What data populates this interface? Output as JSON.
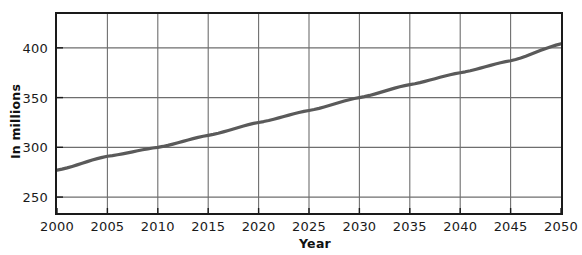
{
  "chart_data": {
    "type": "line",
    "title": "",
    "xlabel": "Year",
    "ylabel": "In millions",
    "x": [
      2000,
      2005,
      2010,
      2015,
      2020,
      2025,
      2030,
      2035,
      2040,
      2045,
      2050
    ],
    "values": [
      277,
      291,
      300,
      312,
      325,
      337,
      350,
      363,
      375,
      387,
      404
    ],
    "series": [
      {
        "name": "Population",
        "values": [
          277,
          291,
          300,
          312,
          325,
          337,
          350,
          363,
          375,
          387,
          404
        ]
      }
    ],
    "xlim": [
      2000,
      2050
    ],
    "ylim": [
      234,
      434
    ],
    "xticks": [
      2000,
      2005,
      2010,
      2015,
      2020,
      2025,
      2030,
      2035,
      2040,
      2045,
      2050
    ],
    "xtick_labels": [
      "2000",
      "2005",
      "2010",
      "2015",
      "2020",
      "2025",
      "2030",
      "2035",
      "2040",
      "2045",
      "2050"
    ],
    "yticks": [
      250,
      300,
      350,
      400
    ],
    "ytick_labels": [
      "250",
      "300",
      "350",
      "400"
    ],
    "grid": true,
    "legend": false,
    "line_color": "#5a5a5a",
    "grid_color": "#6e6e6e",
    "frame_color": "#1a1a1a"
  }
}
